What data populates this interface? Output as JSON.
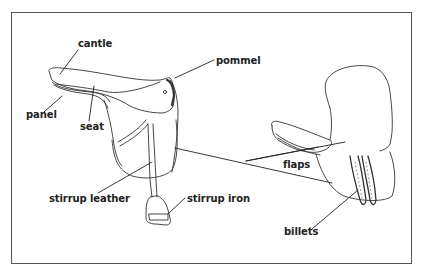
{
  "diagram": {
    "labels": {
      "cantle": "cantle",
      "pommel": "pommel",
      "panel": "panel",
      "seat": "seat",
      "flaps": "flaps",
      "stirrup_leather": "stirrup leather",
      "stirrup_iron": "stirrup iron",
      "billets": "billets"
    },
    "views": [
      "side view of saddle",
      "underside view of saddle showing flaps and billets"
    ]
  },
  "colors": {
    "line": "#333333",
    "border": "#555555",
    "background": "#ffffff"
  }
}
